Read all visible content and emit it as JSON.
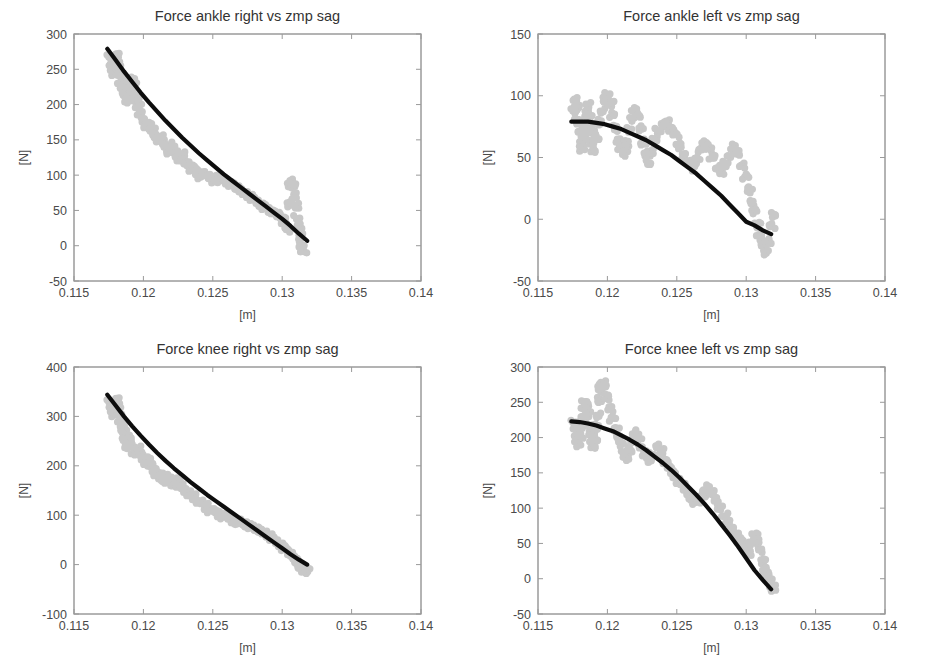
{
  "figure": {
    "background_color": "#ffffff",
    "width": 927,
    "height": 667,
    "layout": "2x2-subplot-grid",
    "scatter_color": "#c8c8c8",
    "fit_color": "#0d0d0d",
    "axis_color": "#9a9a9a"
  },
  "chart_data": [
    {
      "id": "force-ankle-right",
      "type": "scatter",
      "title": "Force ankle right vs zmp sag",
      "xlabel": "[m]",
      "ylabel": "[N]",
      "xlim": [
        0.115,
        0.14
      ],
      "ylim": [
        -50,
        300
      ],
      "xticks": [
        0.115,
        0.12,
        0.125,
        0.13,
        0.135,
        0.14
      ],
      "xticklabels": [
        "0.115",
        "0.12",
        "0.125",
        "0.13",
        "0.135",
        "0.14"
      ],
      "yticks": [
        -50,
        0,
        50,
        100,
        150,
        200,
        250,
        300
      ],
      "yticklabels": [
        "-50",
        "0",
        "50",
        "100",
        "150",
        "200",
        "250",
        "300"
      ],
      "grid": false,
      "legend": "none",
      "series": [
        {
          "name": "measured samples",
          "style": "scatter",
          "color": "#c8c8c8",
          "x": [
            0.1176,
            0.1177,
            0.1178,
            0.1179,
            0.118,
            0.1181,
            0.1182,
            0.1183,
            0.1184,
            0.1185,
            0.1186,
            0.1187,
            0.1188,
            0.1189,
            0.119,
            0.1191,
            0.1192,
            0.1193,
            0.1194,
            0.1195,
            0.1196,
            0.1198,
            0.12,
            0.1202,
            0.1204,
            0.1206,
            0.1208,
            0.121,
            0.1212,
            0.1214,
            0.1216,
            0.1218,
            0.122,
            0.1222,
            0.1224,
            0.1226,
            0.1228,
            0.123,
            0.1232,
            0.1234,
            0.1236,
            0.1238,
            0.124,
            0.1243,
            0.1246,
            0.1249,
            0.1252,
            0.1255,
            0.1258,
            0.1261,
            0.1264,
            0.1267,
            0.127,
            0.1273,
            0.1276,
            0.1279,
            0.1282,
            0.1285,
            0.1288,
            0.1291,
            0.1294,
            0.1297,
            0.13,
            0.1302,
            0.1304,
            0.1305,
            0.1306,
            0.1307,
            0.1308,
            0.1309,
            0.131,
            0.1311,
            0.1312,
            0.1313,
            0.1314,
            0.1315
          ],
          "y": [
            268,
            255,
            246,
            252,
            262,
            270,
            258,
            240,
            228,
            232,
            222,
            214,
            206,
            210,
            218,
            226,
            234,
            228,
            216,
            205,
            198,
            188,
            178,
            170,
            172,
            165,
            156,
            150,
            155,
            148,
            140,
            134,
            142,
            136,
            128,
            122,
            128,
            120,
            114,
            110,
            112,
            106,
            100,
            103,
            98,
            94,
            96,
            92,
            96,
            90,
            86,
            82,
            78,
            74,
            70,
            66,
            62,
            58,
            54,
            50,
            48,
            44,
            38,
            30,
            22,
            60,
            88,
            90,
            86,
            70,
            55,
            40,
            26,
            12,
            2,
            -8
          ]
        },
        {
          "name": "polynomial fit",
          "style": "line",
          "color": "#0d0d0d",
          "x": [
            0.1174,
            0.118,
            0.1186,
            0.1192,
            0.1198,
            0.1204,
            0.121,
            0.1216,
            0.1222,
            0.1228,
            0.1234,
            0.124,
            0.1246,
            0.1252,
            0.1258,
            0.1264,
            0.127,
            0.1276,
            0.1282,
            0.1288,
            0.1294,
            0.13,
            0.1306,
            0.1312,
            0.1318
          ],
          "y": [
            279,
            263,
            247,
            232,
            217,
            203,
            190,
            177,
            165,
            153,
            142,
            131,
            121,
            111,
            101,
            92,
            83,
            74,
            65,
            56,
            47,
            38,
            28,
            17,
            7
          ]
        }
      ]
    },
    {
      "id": "force-ankle-left",
      "type": "scatter",
      "title": "Force ankle left vs zmp sag",
      "xlabel": "[m]",
      "ylabel": "[N]",
      "xlim": [
        0.115,
        0.14
      ],
      "ylim": [
        -50,
        150
      ],
      "xticks": [
        0.115,
        0.12,
        0.125,
        0.13,
        0.135,
        0.14
      ],
      "xticklabels": [
        "0.115",
        "0.12",
        "0.125",
        "0.13",
        "0.135",
        "0.14"
      ],
      "yticks": [
        -50,
        0,
        50,
        100,
        150
      ],
      "yticklabels": [
        "-50",
        "0",
        "50",
        "100",
        "150"
      ],
      "grid": false,
      "legend": "none",
      "series": [
        {
          "name": "measured samples",
          "style": "scatter",
          "color": "#c8c8c8",
          "x": [
            0.1176,
            0.1177,
            0.1178,
            0.1179,
            0.118,
            0.1181,
            0.1182,
            0.1183,
            0.1184,
            0.1185,
            0.1186,
            0.1187,
            0.1188,
            0.1189,
            0.119,
            0.1192,
            0.1194,
            0.1196,
            0.1198,
            0.12,
            0.1202,
            0.1204,
            0.1206,
            0.1208,
            0.121,
            0.1212,
            0.1214,
            0.1216,
            0.1218,
            0.122,
            0.1222,
            0.1224,
            0.1226,
            0.1228,
            0.123,
            0.1232,
            0.1234,
            0.1237,
            0.124,
            0.1243,
            0.1246,
            0.1249,
            0.1252,
            0.1255,
            0.1258,
            0.1261,
            0.1264,
            0.1267,
            0.127,
            0.1273,
            0.1276,
            0.1279,
            0.1282,
            0.1285,
            0.1288,
            0.1291,
            0.1294,
            0.1297,
            0.13,
            0.1302,
            0.1304,
            0.1306,
            0.1308,
            0.131,
            0.1312,
            0.1314,
            0.1316,
            0.1318,
            0.132
          ],
          "y": [
            88,
            96,
            90,
            80,
            70,
            62,
            58,
            66,
            76,
            86,
            92,
            84,
            72,
            62,
            56,
            66,
            78,
            88,
            96,
            100,
            94,
            84,
            74,
            64,
            58,
            54,
            62,
            72,
            82,
            88,
            84,
            74,
            62,
            52,
            46,
            54,
            64,
            72,
            76,
            78,
            74,
            68,
            60,
            52,
            46,
            42,
            48,
            56,
            62,
            58,
            50,
            42,
            38,
            44,
            52,
            58,
            54,
            44,
            34,
            24,
            14,
            6,
            -4,
            -14,
            -22,
            -26,
            -18,
            -6,
            4
          ]
        },
        {
          "name": "polynomial fit",
          "style": "line",
          "color": "#0d0d0d",
          "x": [
            0.1174,
            0.118,
            0.1186,
            0.1192,
            0.1198,
            0.1204,
            0.121,
            0.1216,
            0.1222,
            0.1228,
            0.1234,
            0.124,
            0.1246,
            0.1252,
            0.1258,
            0.1264,
            0.127,
            0.1276,
            0.1282,
            0.1288,
            0.1294,
            0.13,
            0.1306,
            0.1312,
            0.1318
          ],
          "y": [
            79,
            79,
            79,
            78,
            77,
            75,
            73,
            70,
            67,
            64,
            60,
            56,
            52,
            47,
            42,
            37,
            31,
            25,
            19,
            12,
            5,
            -2,
            -5,
            -9,
            -12
          ]
        }
      ]
    },
    {
      "id": "force-knee-right",
      "type": "scatter",
      "title": "Force knee right vs zmp sag",
      "xlabel": "[m]",
      "ylabel": "[N]",
      "xlim": [
        0.115,
        0.14
      ],
      "ylim": [
        -100,
        400
      ],
      "xticks": [
        0.115,
        0.12,
        0.125,
        0.13,
        0.135,
        0.14
      ],
      "xticklabels": [
        "0.115",
        "0.12",
        "0.125",
        "0.13",
        "0.135",
        "0.14"
      ],
      "yticks": [
        -100,
        0,
        100,
        200,
        300,
        400
      ],
      "yticklabels": [
        "-100",
        "0",
        "100",
        "200",
        "300",
        "400"
      ],
      "grid": false,
      "legend": "none",
      "series": [
        {
          "name": "measured samples",
          "style": "scatter",
          "color": "#c8c8c8",
          "x": [
            0.1176,
            0.1177,
            0.1178,
            0.1179,
            0.118,
            0.1181,
            0.1182,
            0.1183,
            0.1184,
            0.1185,
            0.1186,
            0.1187,
            0.1188,
            0.1189,
            0.119,
            0.1192,
            0.1194,
            0.1196,
            0.1198,
            0.12,
            0.1202,
            0.1204,
            0.1206,
            0.1208,
            0.121,
            0.1212,
            0.1214,
            0.1216,
            0.1218,
            0.122,
            0.1222,
            0.1224,
            0.1226,
            0.1228,
            0.123,
            0.1233,
            0.1236,
            0.1239,
            0.1242,
            0.1245,
            0.1248,
            0.1251,
            0.1254,
            0.1257,
            0.126,
            0.1263,
            0.1266,
            0.1269,
            0.1272,
            0.1275,
            0.1278,
            0.1281,
            0.1284,
            0.1287,
            0.129,
            0.1293,
            0.1296,
            0.1299,
            0.1302,
            0.1305,
            0.1308,
            0.131,
            0.1312,
            0.1314,
            0.1316,
            0.1318
          ],
          "y": [
            330,
            318,
            306,
            314,
            326,
            334,
            322,
            300,
            286,
            278,
            266,
            252,
            240,
            248,
            258,
            240,
            226,
            236,
            224,
            212,
            206,
            212,
            202,
            192,
            184,
            178,
            172,
            180,
            174,
            166,
            160,
            172,
            164,
            156,
            150,
            142,
            136,
            130,
            124,
            118,
            112,
            108,
            104,
            100,
            96,
            92,
            88,
            86,
            84,
            80,
            76,
            72,
            68,
            64,
            58,
            52,
            46,
            40,
            32,
            24,
            16,
            8,
            0,
            -8,
            -14,
            -10
          ]
        },
        {
          "name": "polynomial fit",
          "style": "line",
          "color": "#0d0d0d",
          "x": [
            0.1174,
            0.118,
            0.1186,
            0.1192,
            0.1198,
            0.1204,
            0.121,
            0.1216,
            0.1222,
            0.1228,
            0.1234,
            0.124,
            0.1246,
            0.1252,
            0.1258,
            0.1264,
            0.127,
            0.1276,
            0.1282,
            0.1288,
            0.1294,
            0.13,
            0.1306,
            0.1312,
            0.1318
          ],
          "y": [
            344,
            322,
            300,
            280,
            261,
            243,
            226,
            210,
            195,
            181,
            167,
            154,
            141,
            129,
            117,
            105,
            93,
            81,
            69,
            57,
            45,
            33,
            21,
            10,
            0
          ]
        }
      ]
    },
    {
      "id": "force-knee-left",
      "type": "scatter",
      "title": "Force knee left vs zmp sag",
      "xlabel": "[m]",
      "ylabel": "[N]",
      "xlim": [
        0.115,
        0.14
      ],
      "ylim": [
        -50,
        300
      ],
      "xticks": [
        0.115,
        0.12,
        0.125,
        0.13,
        0.135,
        0.14
      ],
      "xticklabels": [
        "0.115",
        "0.12",
        "0.125",
        "0.13",
        "0.135",
        "0.14"
      ],
      "yticks": [
        -50,
        0,
        50,
        100,
        150,
        200,
        250,
        300
      ],
      "yticklabels": [
        "-50",
        "0",
        "50",
        "100",
        "150",
        "200",
        "250",
        "300"
      ],
      "grid": false,
      "legend": "none",
      "series": [
        {
          "name": "measured samples",
          "style": "scatter",
          "color": "#c8c8c8",
          "x": [
            0.1176,
            0.1177,
            0.1178,
            0.1179,
            0.118,
            0.1181,
            0.1182,
            0.1183,
            0.1184,
            0.1185,
            0.1186,
            0.1187,
            0.1188,
            0.1189,
            0.119,
            0.1191,
            0.1192,
            0.1193,
            0.1194,
            0.1195,
            0.1196,
            0.1198,
            0.12,
            0.1202,
            0.1204,
            0.1206,
            0.1208,
            0.121,
            0.1212,
            0.1214,
            0.1216,
            0.1218,
            0.122,
            0.1222,
            0.1224,
            0.1227,
            0.123,
            0.1233,
            0.1236,
            0.1239,
            0.1242,
            0.1245,
            0.1248,
            0.1251,
            0.1254,
            0.1257,
            0.126,
            0.1263,
            0.1266,
            0.1269,
            0.1272,
            0.1275,
            0.1278,
            0.1281,
            0.1284,
            0.1287,
            0.129,
            0.1293,
            0.1296,
            0.1299,
            0.1302,
            0.1304,
            0.1306,
            0.1308,
            0.131,
            0.1312,
            0.1314,
            0.1316,
            0.1318,
            0.132
          ],
          "y": [
            222,
            212,
            200,
            192,
            202,
            216,
            228,
            240,
            250,
            244,
            232,
            218,
            206,
            196,
            188,
            198,
            214,
            232,
            252,
            268,
            278,
            272,
            258,
            242,
            226,
            212,
            200,
            190,
            180,
            172,
            182,
            196,
            206,
            200,
            188,
            176,
            168,
            176,
            186,
            180,
            168,
            156,
            148,
            140,
            132,
            124,
            116,
            108,
            112,
            120,
            128,
            122,
            112,
            100,
            90,
            80,
            70,
            62,
            54,
            46,
            38,
            50,
            62,
            54,
            40,
            26,
            12,
            2,
            -8,
            -14
          ]
        },
        {
          "name": "polynomial fit",
          "style": "line",
          "color": "#0d0d0d",
          "x": [
            0.1174,
            0.118,
            0.1186,
            0.1192,
            0.1198,
            0.1204,
            0.121,
            0.1216,
            0.1222,
            0.1228,
            0.1234,
            0.124,
            0.1246,
            0.1252,
            0.1258,
            0.1264,
            0.127,
            0.1276,
            0.1282,
            0.1288,
            0.1294,
            0.13,
            0.1306,
            0.1312,
            0.1318
          ],
          "y": [
            223,
            222,
            220,
            217,
            213,
            209,
            203,
            197,
            190,
            182,
            173,
            164,
            154,
            143,
            131,
            119,
            106,
            92,
            77,
            62,
            46,
            29,
            12,
            -2,
            -15
          ]
        }
      ]
    }
  ]
}
